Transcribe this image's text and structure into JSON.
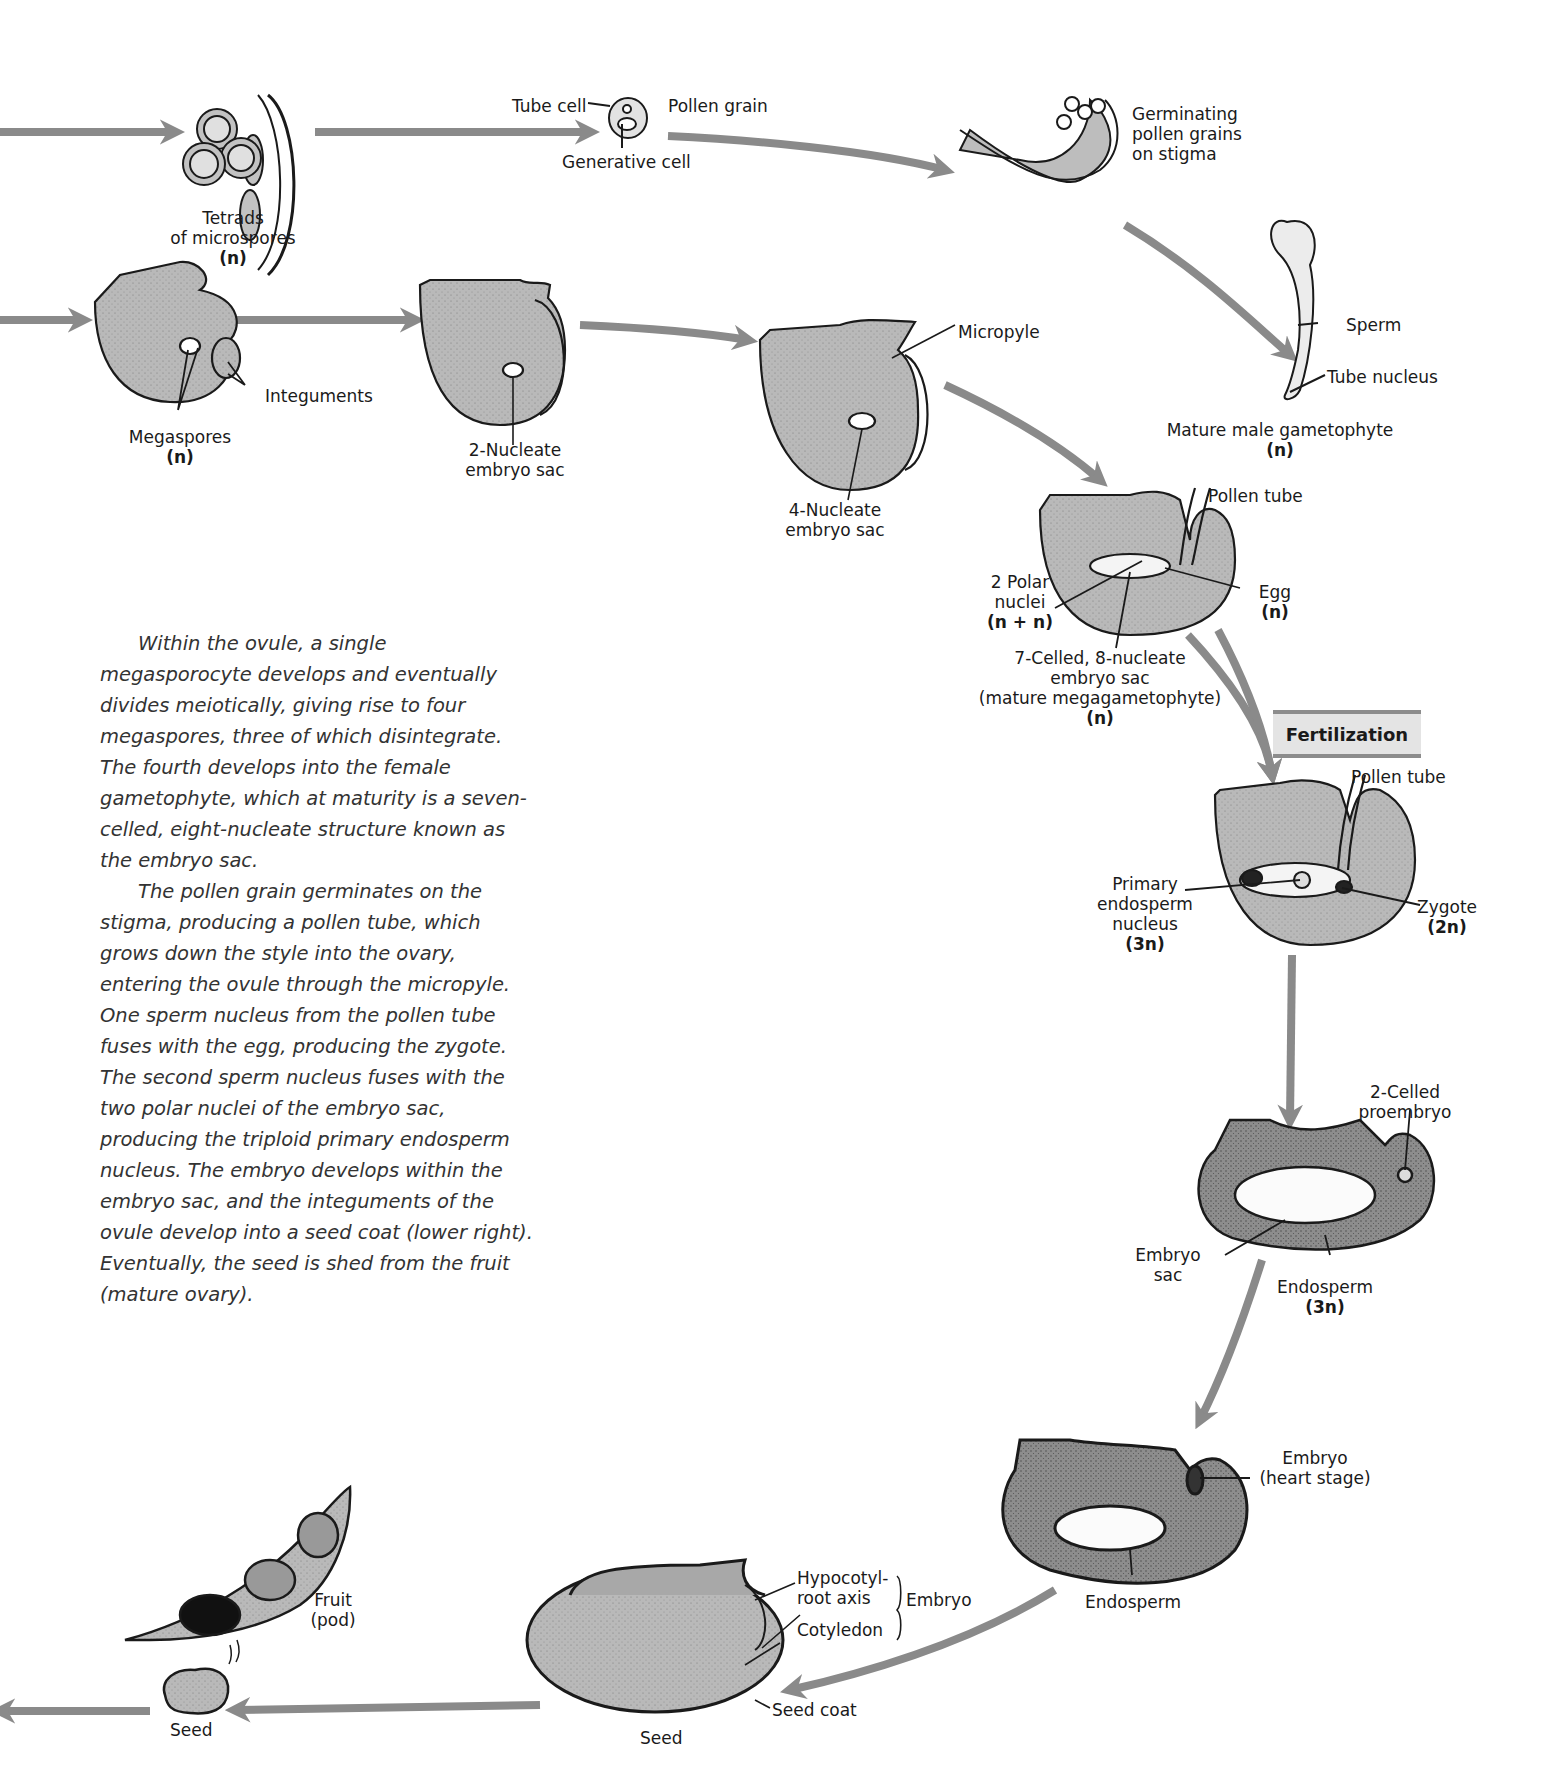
{
  "diagram": {
    "arrow_color": "#8a8a8a",
    "tissue_fill": "#b9b9b9",
    "male_pathway": {
      "tetrads": {
        "label_line1": "Tetrads",
        "label_line2": "of microspores",
        "ploidy": "(n)"
      },
      "pollen_grain": {
        "label": "Pollen grain",
        "tube_cell": "Tube cell",
        "generative_cell": "Generative cell"
      },
      "germinating": {
        "line1": "Germinating",
        "line2": "pollen grains",
        "line3": "on stigma"
      },
      "mature_male": {
        "sperm": "Sperm",
        "tube_nucleus": "Tube nucleus",
        "label": "Mature male gametophyte",
        "ploidy": "(n)"
      }
    },
    "female_pathway": {
      "megaspores": {
        "label": "Megaspores",
        "ploidy": "(n)",
        "integuments": "Integuments"
      },
      "two_nucleate": {
        "line1": "2-Nucleate",
        "line2": "embryo sac"
      },
      "four_nucleate": {
        "line1": "4-Nucleate",
        "line2": "embryo sac",
        "micropyle": "Micropyle"
      },
      "mature_sac": {
        "pollen_tube": "Pollen tube",
        "polar_line1": "2 Polar",
        "polar_line2": "nuclei",
        "polar_ploidy": "(n + n)",
        "egg": "Egg",
        "egg_ploidy": "(n)",
        "sac_line1": "7-Celled, 8-nucleate",
        "sac_line2": "embryo sac",
        "sac_line3": "(mature megagametophyte)",
        "sac_ploidy": "(n)"
      }
    },
    "fertilization": {
      "banner": "Fertilization",
      "pollen_tube": "Pollen tube",
      "primary_line1": "Primary",
      "primary_line2": "endosperm",
      "primary_line3": "nucleus",
      "primary_ploidy": "(3n)",
      "zygote": "Zygote",
      "zygote_ploidy": "(2n)"
    },
    "proembryo": {
      "proembryo_line1": "2-Celled",
      "proembryo_line2": "proembryo",
      "sac_line1": "Embryo",
      "sac_line2": "sac",
      "endosperm": "Endosperm",
      "endosperm_ploidy": "(3n)"
    },
    "heart_stage": {
      "embryo_line1": "Embryo",
      "embryo_line2": "(heart stage)",
      "endosperm": "Endosperm"
    },
    "seed_section": {
      "hypocotyl_line1": "Hypocotyl-",
      "hypocotyl_line2": "root axis",
      "cotyledon": "Cotyledon",
      "embryo": "Embryo",
      "seed_coat": "Seed coat",
      "label": "Seed"
    },
    "fruit": {
      "line1": "Fruit",
      "line2": "(pod)",
      "seed": "Seed"
    }
  },
  "caption": {
    "paragraphs": [
      "Within the ovule, a single megasporocyte develops and eventually divides meiotically, giving rise to four megaspores, three of which disintegrate. The fourth develops into the female gametophyte, which at maturity is a seven-celled, eight-nucleate structure known as the embryo sac.",
      "The pollen grain germinates on the stigma, producing a pollen tube, which grows down the style into the ovary, entering the ovule through the micropyle. One sperm nucleus from the pollen tube fuses with the egg, producing the zygote. The second sperm nucleus fuses with the two polar nuclei of the embryo sac, producing the triploid primary endosperm nucleus. The embryo develops within the embryo sac, and the integuments of the ovule develop into a seed coat (lower right). Eventually, the seed is shed from the fruit (mature ovary)."
    ]
  }
}
